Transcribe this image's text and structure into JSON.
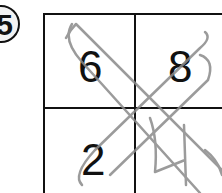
{
  "problem": {
    "number": "5"
  },
  "grid": {
    "cells": [
      {
        "position": "top-left",
        "value": "6"
      },
      {
        "position": "top-right",
        "value": "8"
      },
      {
        "position": "bottom-left",
        "value": "2"
      },
      {
        "position": "bottom-right",
        "value": ""
      }
    ]
  },
  "handwriting": {
    "answer_digit": "4",
    "color": "#8a8a8a"
  },
  "colors": {
    "ink": "#111111",
    "pencil": "#8a8a8a",
    "background": "#ffffff"
  }
}
